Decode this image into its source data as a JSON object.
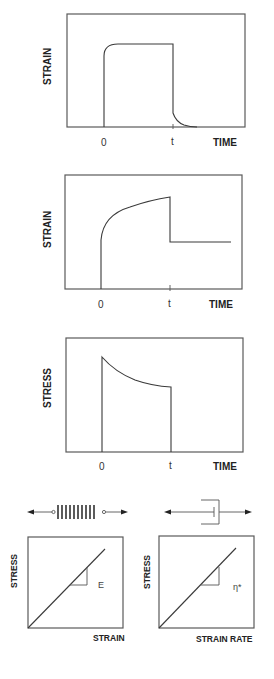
{
  "panels": [
    {
      "id": "strain-recovery",
      "ylabel": "STRAIN",
      "xlabel": "TIME",
      "ticks": [
        "0",
        "t"
      ]
    },
    {
      "id": "creep",
      "ylabel": "STRAIN",
      "xlabel": "TIME",
      "ticks": [
        "0",
        "t"
      ]
    },
    {
      "id": "stress-relaxation",
      "ylabel": "STRESS",
      "xlabel": "TIME",
      "ticks": [
        "0",
        "t"
      ]
    },
    {
      "id": "spring-model",
      "ylabel": "STRESS",
      "xlabel": "STRAIN",
      "slope_label": "E"
    },
    {
      "id": "dashpot-model",
      "ylabel": "STRESS",
      "xlabel": "STRAIN RATE",
      "slope_label": "η*"
    }
  ],
  "icons": {
    "spring": "spring-icon",
    "dashpot": "dashpot-icon"
  },
  "colors": {
    "line": "#3a3a3a",
    "frame": "#5a5a5a",
    "background": "#ffffff"
  }
}
